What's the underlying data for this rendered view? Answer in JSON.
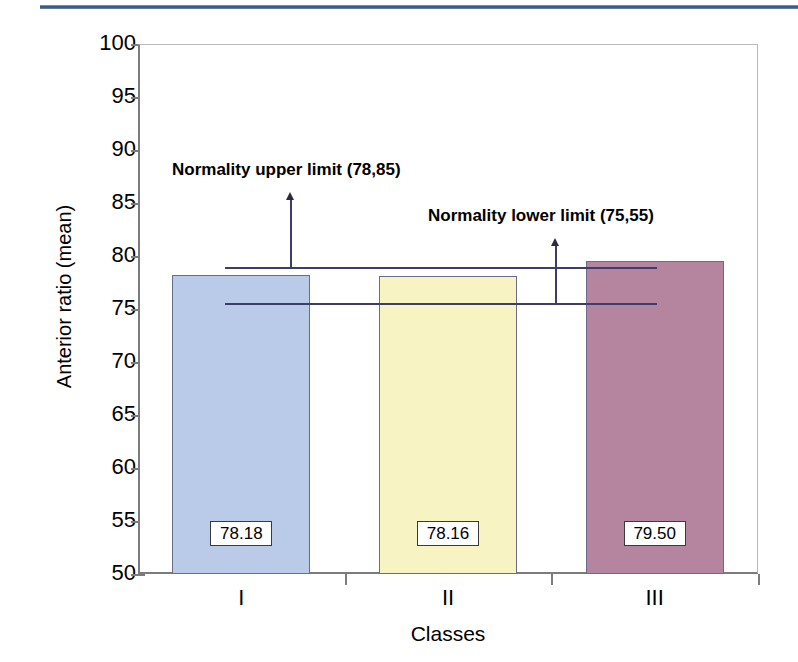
{
  "chart_data": {
    "type": "bar",
    "title": "",
    "xlabel": "Classes",
    "ylabel": "Anterior ratio (mean)",
    "categories": [
      "I",
      "II",
      "III"
    ],
    "values": [
      78.18,
      78.16,
      79.5
    ],
    "value_labels": [
      "78.18",
      "78.16",
      "79.50"
    ],
    "series": [
      {
        "name": "Anterior ratio (mean)",
        "values": [
          78.18,
          78.16,
          79.5
        ]
      }
    ],
    "bar_colors": [
      "#b9cbe9",
      "#f8f3c3",
      "#b5849f"
    ],
    "bar_border_color": "#6b6b8c",
    "ylim": [
      50,
      100
    ],
    "ytick_labels": [
      "100",
      "95",
      "90",
      "85",
      "80",
      "75",
      "70",
      "65",
      "60",
      "55",
      "50"
    ],
    "ytick_values": [
      100,
      95,
      90,
      85,
      80,
      75,
      70,
      65,
      60,
      55,
      50
    ],
    "grid": false,
    "legend": "none",
    "reference_lines": [
      {
        "name": "normality-upper-limit",
        "label": "Normality upper limit (78,85)",
        "value": 78.85,
        "color": "#3d3d6b"
      },
      {
        "name": "normality-lower-limit",
        "label": "Normality lower limit (75,55)",
        "value": 75.55,
        "color": "#3d3d6b"
      }
    ],
    "annotations": [
      "Normality upper limit (78,85)",
      "Normality lower limit (75,55)"
    ]
  },
  "decor": {
    "top_rule_color": "#2a4a74"
  }
}
